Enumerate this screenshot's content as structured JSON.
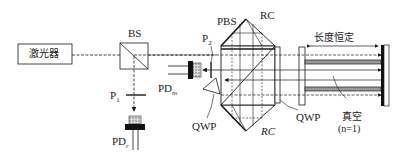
{
  "diagram": {
    "components": {
      "laser": {
        "label": "激光器"
      },
      "beam_splitter": {
        "label": "BS"
      },
      "polarizer_1": {
        "label": "P",
        "subscript": "1"
      },
      "polarizer_2": {
        "label": "P",
        "subscript": "2"
      },
      "photodetector_reference": {
        "label": "PD",
        "subscript": "r"
      },
      "photodetector_measure": {
        "label": "PD",
        "subscript": "m"
      },
      "polarizing_beam_splitter": {
        "label": "PBS"
      },
      "retroreflector_top": {
        "label": "RC"
      },
      "retroreflector_bottom": {
        "label": "RC"
      },
      "quarter_wave_plate_left": {
        "label": "QWP"
      },
      "quarter_wave_plate_right": {
        "label": "QWP"
      },
      "length_constant": {
        "label": "长度恒定"
      },
      "vacuum": {
        "label": "真空",
        "note": "(n=1)"
      }
    },
    "colors": {
      "line": "#1a1a1a",
      "background": "#ffffff",
      "detector_fill": "#111111",
      "speckle": "#888888"
    }
  }
}
